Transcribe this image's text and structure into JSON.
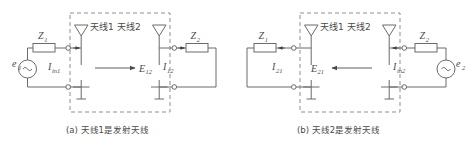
{
  "figure": {
    "title_hidden": "",
    "panels": [
      {
        "id": "a",
        "caption": "(a) 天线1是发射天线",
        "antenna_left_label": "天线1",
        "antenna_right_label": "天线2",
        "source_label": "e",
        "source_sub": "1",
        "source_glyph": "~",
        "impedance_left_label": "Z",
        "impedance_left_sub": "1",
        "impedance_right_label": "Z",
        "impedance_right_sub": "2",
        "current_left_label": "I",
        "current_left_sub": "in1",
        "current_right_label": "I",
        "current_right_sub": "12",
        "field_label": "E",
        "field_sub": "12",
        "field_direction": "right"
      },
      {
        "id": "b",
        "caption": "(b) 天线2是发射天线",
        "antenna_left_label": "天线1",
        "antenna_right_label": "天线2",
        "source_label": "e",
        "source_sub": "2",
        "source_glyph": "~",
        "impedance_left_label": "Z",
        "impedance_left_sub": "1",
        "impedance_right_label": "Z",
        "impedance_right_sub": "2",
        "current_left_label": "I",
        "current_left_sub": "21",
        "current_right_label": "I",
        "current_right_sub": "in2",
        "field_label": "E",
        "field_sub": "21",
        "field_direction": "left"
      }
    ],
    "colors": {
      "wire": "#6b6b6b",
      "dashed_box": "#8f8f8f",
      "text": "#4a4a4a",
      "background": "#ffffff"
    }
  }
}
